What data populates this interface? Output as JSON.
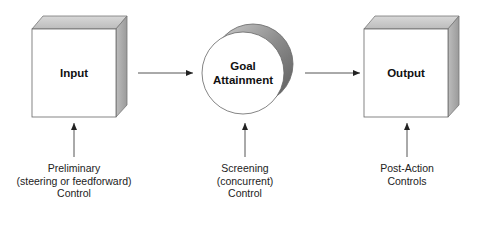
{
  "diagram": {
    "nodes": {
      "input": {
        "label": "Input"
      },
      "goal": {
        "label_lines": [
          "Goal",
          "Attainment"
        ]
      },
      "output": {
        "label": "Output"
      }
    },
    "controls": {
      "preliminary": {
        "lines": [
          "Preliminary",
          "(steering or feedforward)",
          "Control"
        ]
      },
      "screening": {
        "lines": [
          "Screening",
          "(concurrent)",
          "Control"
        ]
      },
      "post_action": {
        "lines": [
          "Post-Action",
          "Controls"
        ]
      }
    },
    "edges": [
      {
        "from": "input",
        "to": "goal"
      },
      {
        "from": "goal",
        "to": "output"
      },
      {
        "from": "preliminary",
        "to": "input"
      },
      {
        "from": "screening",
        "to": "goal"
      },
      {
        "from": "post_action",
        "to": "output"
      }
    ],
    "colors": {
      "line": "#555555",
      "box_top": "#c8c8c8",
      "box_side": "#a8a8a8",
      "crescent": "#8a8a8a"
    }
  }
}
